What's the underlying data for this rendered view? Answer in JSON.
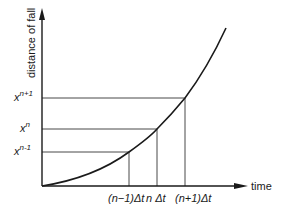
{
  "diagram": {
    "y_axis_label": "distance of fall",
    "x_axis_label": "time",
    "y_ticks": [
      {
        "base": "x",
        "sup": "n+1"
      },
      {
        "base": "x",
        "sup": "n"
      },
      {
        "base": "x",
        "sup": "n-1"
      }
    ],
    "x_ticks": [
      "(n−1)Δt",
      "n Δt",
      "(n+1)Δt"
    ],
    "colors": {
      "line": "#1a1a1a",
      "background": "#ffffff"
    }
  }
}
